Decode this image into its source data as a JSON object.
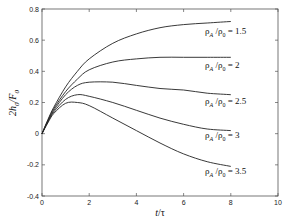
{
  "chart_data": {
    "type": "line",
    "title": "",
    "xlabel": "t/τ",
    "ylabel": "2h0/F0",
    "xlim": [
      0,
      10
    ],
    "ylim": [
      -0.4,
      0.8
    ],
    "xticks": [
      0,
      2,
      4,
      6,
      8,
      10
    ],
    "yticks": [
      -0.4,
      -0.2,
      0,
      0.2,
      0.4,
      0.6,
      0.8
    ],
    "xtick_labels": [
      "0",
      "2",
      "4",
      "6",
      "8",
      "10"
    ],
    "ytick_labels": [
      "-0.4",
      "-0.2",
      "0",
      "0.2",
      "0.4",
      "0.6",
      "0.8"
    ],
    "grid": false,
    "legend": "inline annotations at right end of curves",
    "x": [
      0,
      0.25,
      0.5,
      1,
      1.5,
      2,
      3,
      4,
      5,
      6,
      7,
      8
    ],
    "series": [
      {
        "name": "ρA/ρ0 = 1.5",
        "values": [
          0,
          0.09,
          0.17,
          0.3,
          0.4,
          0.48,
          0.58,
          0.64,
          0.68,
          0.7,
          0.71,
          0.72
        ]
      },
      {
        "name": "ρA/ρ0 = 2",
        "values": [
          0,
          0.085,
          0.16,
          0.27,
          0.35,
          0.41,
          0.46,
          0.48,
          0.49,
          0.49,
          0.49,
          0.49
        ]
      },
      {
        "name": "ρA/ρ0 = 2.5",
        "values": [
          0,
          0.08,
          0.15,
          0.25,
          0.31,
          0.33,
          0.33,
          0.31,
          0.29,
          0.28,
          0.26,
          0.25
        ]
      },
      {
        "name": "ρA/ρ0 = 3",
        "values": [
          0,
          0.075,
          0.14,
          0.22,
          0.25,
          0.24,
          0.2,
          0.15,
          0.1,
          0.06,
          0.03,
          0.02
        ]
      },
      {
        "name": "ρA/ρ0 = 3.5",
        "values": [
          0,
          0.07,
          0.13,
          0.195,
          0.2,
          0.18,
          0.1,
          0.02,
          -0.06,
          -0.13,
          -0.18,
          -0.21
        ]
      }
    ]
  },
  "annotations": [
    {
      "text": "ρA/ρ0 = 1.5",
      "base": "ρ",
      "sub1": "A",
      "mid": " /ρ",
      "sub2": "0",
      "tail": " = 1.5"
    },
    {
      "text": "ρA/ρ0 = 2",
      "base": "ρ",
      "sub1": "A",
      "mid": " /ρ",
      "sub2": "0",
      "tail": " = 2"
    },
    {
      "text": "ρA/ρ0 = 2.5",
      "base": "ρ",
      "sub1": "A",
      "mid": " /ρ",
      "sub2": "0",
      "tail": " = 2.5"
    },
    {
      "text": "ρA/ρ0 = 3",
      "base": "ρ",
      "sub1": "A",
      "mid": " /ρ",
      "sub2": "0",
      "tail": " = 3"
    },
    {
      "text": "ρA/ρ0 = 3.5",
      "base": "ρ",
      "sub1": "A",
      "mid": " /ρ",
      "sub2": "0",
      "tail": " = 3.5"
    }
  ],
  "labels": {
    "xlabel_main": "t",
    "xlabel_rest": "/τ",
    "ylabel_a": "2h",
    "ylabel_sub1": "0",
    "ylabel_b": "/F",
    "ylabel_sub2": "0"
  }
}
